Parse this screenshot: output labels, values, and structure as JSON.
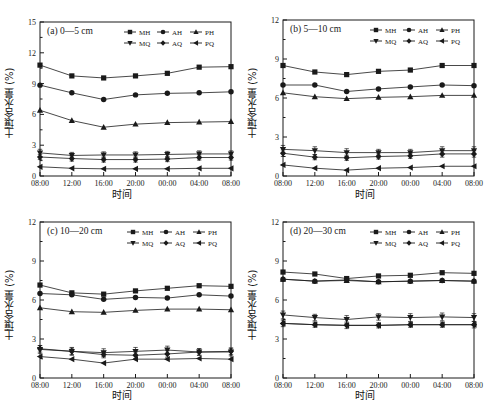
{
  "figure": {
    "axis_labels": {
      "x": "时间",
      "y": "土壤含水量 (%)"
    },
    "x_ticks": [
      "08:00",
      "12:00",
      "16:00",
      "20:00",
      "00:00",
      "04:00",
      "08:00"
    ],
    "legend_entries": [
      "MH",
      "AH",
      "PH",
      "MQ",
      "AQ",
      "PQ"
    ],
    "markers": {
      "MH": "filled-square",
      "AH": "filled-circle",
      "PH": "filled-triangle-up",
      "MQ": "filled-triangle-down",
      "AQ": "filled-diamond",
      "PQ": "filled-triangle-left"
    },
    "line_color": "#1a1a1a",
    "panels": [
      "a",
      "b",
      "c",
      "d"
    ]
  },
  "chart_data": [
    {
      "type": "line",
      "panel": "a",
      "title": "(a) 0—5 cm",
      "xlabel": "时间",
      "ylabel": "土壤含水量 (%)",
      "x": [
        "08:00",
        "12:00",
        "16:00",
        "20:00",
        "00:00",
        "04:00",
        "08:00"
      ],
      "ylim": [
        0,
        15
      ],
      "yticks": [
        0,
        3,
        6,
        9,
        12,
        15
      ],
      "grid": false,
      "legend_position": "top-right-inside",
      "series": [
        {
          "name": "MH",
          "marker": "filled-square",
          "values": [
            10.8,
            9.75,
            9.55,
            9.75,
            10.0,
            10.6,
            10.65
          ]
        },
        {
          "name": "AH",
          "marker": "filled-circle",
          "values": [
            8.85,
            8.1,
            7.45,
            7.9,
            8.05,
            8.1,
            8.2
          ]
        },
        {
          "name": "PH",
          "marker": "filled-triangle-up",
          "values": [
            6.4,
            5.4,
            4.75,
            5.05,
            5.2,
            5.25,
            5.3
          ]
        },
        {
          "name": "MQ",
          "marker": "filled-triangle-down",
          "values": [
            2.25,
            2.0,
            2.05,
            2.05,
            2.1,
            2.15,
            2.15
          ],
          "error": [
            0.35,
            0.3,
            0.3,
            0.3,
            0.3,
            0.3,
            0.3
          ]
        },
        {
          "name": "AQ",
          "marker": "filled-diamond",
          "values": [
            1.85,
            1.7,
            1.6,
            1.6,
            1.65,
            1.8,
            1.8
          ],
          "error": [
            0.25,
            0.25,
            0.25,
            0.25,
            0.25,
            0.25,
            0.25
          ]
        },
        {
          "name": "PQ",
          "marker": "filled-triangle-left",
          "values": [
            0.9,
            0.75,
            0.7,
            0.7,
            0.7,
            0.75,
            0.75
          ]
        }
      ]
    },
    {
      "type": "line",
      "panel": "b",
      "title": "(b) 5—10 cm",
      "xlabel": "时间",
      "ylabel": "土壤含水量 (%)",
      "x": [
        "08:00",
        "12:00",
        "16:00",
        "20:00",
        "00:00",
        "04:00",
        "08:00"
      ],
      "ylim": [
        0,
        12
      ],
      "yticks": [
        0,
        3,
        6,
        9,
        12
      ],
      "grid": false,
      "legend_position": "top-right-inside",
      "series": [
        {
          "name": "MH",
          "marker": "filled-square",
          "values": [
            8.5,
            8.0,
            7.8,
            8.05,
            8.15,
            8.5,
            8.5
          ]
        },
        {
          "name": "AH",
          "marker": "filled-circle",
          "values": [
            7.0,
            7.0,
            6.5,
            6.7,
            6.85,
            7.0,
            6.95
          ]
        },
        {
          "name": "PH",
          "marker": "filled-triangle-up",
          "values": [
            6.4,
            6.1,
            5.95,
            6.05,
            6.1,
            6.2,
            6.2
          ]
        },
        {
          "name": "MQ",
          "marker": "filled-triangle-down",
          "values": [
            2.05,
            1.95,
            1.8,
            1.8,
            1.8,
            1.95,
            1.95
          ],
          "error": [
            0.3,
            0.3,
            0.3,
            0.25,
            0.25,
            0.3,
            0.3
          ]
        },
        {
          "name": "AQ",
          "marker": "filled-diamond",
          "values": [
            1.75,
            1.45,
            1.4,
            1.5,
            1.55,
            1.7,
            1.7
          ],
          "error": [
            0.25,
            0.2,
            0.2,
            0.2,
            0.2,
            0.25,
            0.25
          ]
        },
        {
          "name": "PQ",
          "marker": "filled-triangle-left",
          "values": [
            0.85,
            0.6,
            0.45,
            0.6,
            0.65,
            0.75,
            0.75
          ]
        }
      ]
    },
    {
      "type": "line",
      "panel": "c",
      "title": "(c) 10—20 cm",
      "xlabel": "时间",
      "ylabel": "土壤含水量 (%)",
      "x": [
        "08:00",
        "12:00",
        "16:00",
        "20:00",
        "00:00",
        "04:00",
        "08:00"
      ],
      "ylim": [
        0,
        12
      ],
      "yticks": [
        0,
        3,
        6,
        9,
        12
      ],
      "grid": false,
      "legend_position": "top-right-inside",
      "series": [
        {
          "name": "MH",
          "marker": "filled-square",
          "values": [
            7.15,
            6.55,
            6.45,
            6.7,
            6.9,
            7.1,
            7.05
          ]
        },
        {
          "name": "AH",
          "marker": "filled-circle",
          "values": [
            6.5,
            6.4,
            6.05,
            6.2,
            6.15,
            6.4,
            6.3
          ]
        },
        {
          "name": "PH",
          "marker": "filled-triangle-up",
          "values": [
            5.4,
            5.1,
            5.05,
            5.2,
            5.3,
            5.3,
            5.25
          ]
        },
        {
          "name": "MQ",
          "marker": "filled-triangle-down",
          "values": [
            2.2,
            2.05,
            1.95,
            2.05,
            2.15,
            2.0,
            2.0
          ],
          "error": [
            0.3,
            0.3,
            0.3,
            0.3,
            0.3,
            0.25,
            0.3
          ]
        },
        {
          "name": "AQ",
          "marker": "filled-diamond",
          "values": [
            2.25,
            2.05,
            1.8,
            1.75,
            1.85,
            2.0,
            2.05
          ],
          "error": [
            0.25,
            0.25,
            0.25,
            0.25,
            0.25,
            0.25,
            0.25
          ]
        },
        {
          "name": "PQ",
          "marker": "filled-triangle-left",
          "values": [
            1.65,
            1.45,
            1.15,
            1.45,
            1.45,
            1.5,
            1.45
          ]
        }
      ]
    },
    {
      "type": "line",
      "panel": "d",
      "title": "(d) 20—30 cm",
      "xlabel": "时间",
      "ylabel": "土壤含水量 (%)",
      "x": [
        "08:00",
        "12:00",
        "16:00",
        "20:00",
        "00:00",
        "04:00",
        "08:00"
      ],
      "ylim": [
        0,
        12
      ],
      "yticks": [
        0,
        3,
        6,
        9,
        12
      ],
      "grid": false,
      "legend_position": "top-right-inside",
      "series": [
        {
          "name": "MH",
          "marker": "filled-square",
          "values": [
            8.15,
            8.0,
            7.65,
            7.85,
            7.9,
            8.1,
            8.05
          ]
        },
        {
          "name": "AH",
          "marker": "filled-circle",
          "values": [
            7.6,
            7.45,
            7.55,
            7.4,
            7.45,
            7.5,
            7.45
          ]
        },
        {
          "name": "PH",
          "marker": "filled-triangle-up",
          "values": [
            7.6,
            7.45,
            7.5,
            7.4,
            7.45,
            7.5,
            7.45
          ]
        },
        {
          "name": "MQ",
          "marker": "filled-triangle-down",
          "values": [
            4.85,
            4.65,
            4.5,
            4.7,
            4.65,
            4.7,
            4.65
          ],
          "error": [
            0.3,
            0.25,
            0.3,
            0.25,
            0.3,
            0.3,
            0.3
          ]
        },
        {
          "name": "AQ",
          "marker": "filled-diamond",
          "values": [
            4.2,
            4.1,
            4.05,
            4.05,
            4.1,
            4.1,
            4.1
          ],
          "error": [
            0.25,
            0.2,
            0.25,
            0.2,
            0.2,
            0.2,
            0.25
          ]
        },
        {
          "name": "PQ",
          "marker": "filled-triangle-left",
          "values": [
            4.2,
            4.1,
            4.05,
            4.05,
            4.1,
            4.1,
            4.1
          ]
        }
      ]
    }
  ]
}
